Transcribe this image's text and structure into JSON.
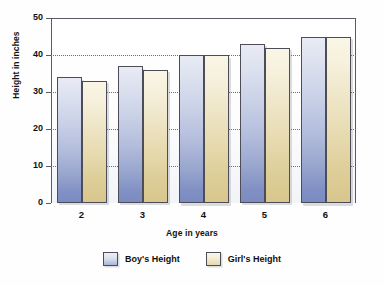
{
  "chart_data": {
    "type": "bar",
    "title": "",
    "xlabel": "Age in years",
    "ylabel": "Height in inches",
    "categories": [
      "2",
      "3",
      "4",
      "5",
      "6"
    ],
    "series": [
      {
        "name": "Boy's Height",
        "color": "#aab5d8",
        "values": [
          34,
          37,
          40,
          43,
          45
        ]
      },
      {
        "name": "Girl's Height",
        "color": "#e5d8ae",
        "values": [
          33,
          36,
          40,
          42,
          45
        ]
      }
    ],
    "ylim": [
      0,
      50
    ],
    "yticks": [
      0,
      10,
      20,
      30,
      40,
      50
    ],
    "xticks": [
      "2",
      "3",
      "4",
      "5",
      "6"
    ],
    "grid": true,
    "grid_axis": "y",
    "grid_style": "dotted",
    "legend": [
      "Boy's Height",
      "Girl's Height"
    ],
    "legend_position": "bottom-center"
  }
}
